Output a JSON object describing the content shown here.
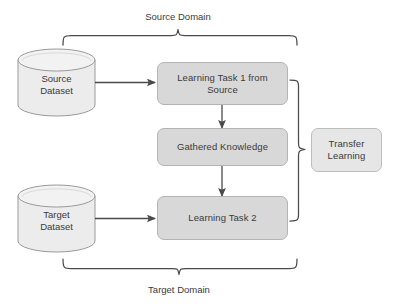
{
  "diagram": {
    "title_top": "Source Domain",
    "title_bottom": "Target Domain",
    "colors": {
      "box_fill": "#d8d8d8",
      "box_stroke": "#b4b4b4",
      "transfer_fill": "#e6e6e6",
      "cylinder_fill": "#ececec",
      "cylinder_stroke": "#9a9a9a",
      "line": "#4a4a4a",
      "text": "#3a3a3a",
      "background": "#ffffff"
    },
    "datasets": [
      {
        "id": "source-dataset",
        "line1": "Source",
        "line2": "Dataset"
      },
      {
        "id": "target-dataset",
        "line1": "Target",
        "line2": "Dataset"
      }
    ],
    "tasks": [
      {
        "id": "learning-task-1",
        "line1": "Learning Task 1 from",
        "line2": "Source"
      },
      {
        "id": "gathered-knowledge",
        "line1": "Gathered Knowledge",
        "line2": ""
      },
      {
        "id": "learning-task-2",
        "line1": "Learning Task 2",
        "line2": ""
      }
    ],
    "transfer": {
      "id": "transfer-learning",
      "line1": "Transfer",
      "line2": "Learning"
    },
    "braces": [
      {
        "id": "source-domain-brace",
        "label": "Source Domain",
        "position": "top"
      },
      {
        "id": "target-domain-brace",
        "label": "Target Domain",
        "position": "bottom"
      },
      {
        "id": "transfer-learning-brace",
        "label": "",
        "position": "right"
      }
    ],
    "edges": [
      {
        "from": "source-dataset",
        "to": "learning-task-1"
      },
      {
        "from": "learning-task-1",
        "to": "gathered-knowledge"
      },
      {
        "from": "gathered-knowledge",
        "to": "learning-task-2"
      },
      {
        "from": "target-dataset",
        "to": "learning-task-2"
      }
    ]
  }
}
